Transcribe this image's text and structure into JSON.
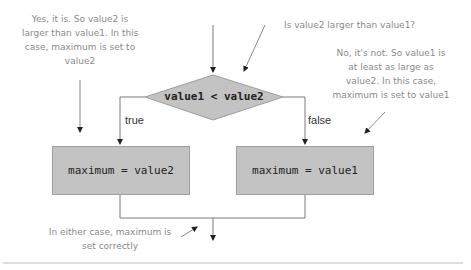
{
  "diagram": {
    "type": "flowchart",
    "decision": {
      "label": "value1 < value2"
    },
    "branches": {
      "true": {
        "label": "true",
        "action": "maximum = value2"
      },
      "false": {
        "label": "false",
        "action": "maximum = value1"
      }
    },
    "annotations": {
      "top_question": "Is value2 larger than value1?",
      "left_yes": [
        "Yes, it is. So value2 is",
        "larger than value1. In this",
        "case, maximum is set to",
        "value2"
      ],
      "right_no": [
        "No, it's not. So value1 is",
        "at least as large as",
        "value2. In this case,",
        "maximum is set to value1"
      ],
      "bottom_either": [
        "In either case, maximum is",
        "set correctly"
      ]
    },
    "colors": {
      "shape_fill": "#c3c3c3",
      "shape_border": "#9e9e9e",
      "line": "#7a7a7a",
      "annotation_text": "#8a8a8a"
    }
  }
}
